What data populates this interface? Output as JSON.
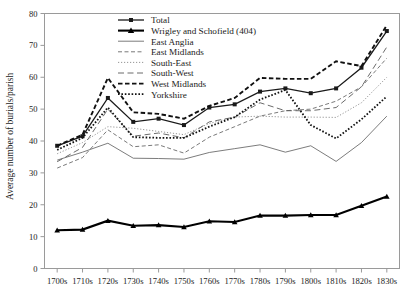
{
  "chart_data": {
    "type": "line",
    "title": "",
    "xlabel": "",
    "ylabel": "Average number of burials/parish",
    "ylim": [
      0,
      80
    ],
    "yticks": [
      0,
      10,
      20,
      30,
      40,
      50,
      60,
      70,
      80
    ],
    "grid": false,
    "legend_position": "top-center",
    "categories": [
      "1700s",
      "1710s",
      "1720s",
      "1730s",
      "1740s",
      "1750s",
      "1760s",
      "1770s",
      "1780s",
      "1790s",
      "1800s",
      "1810s",
      "1820s",
      "1830s"
    ],
    "series": [
      {
        "name": "Total",
        "style": "solid-square-marker",
        "color": "#1a1a1a",
        "values": [
          38.5,
          41.5,
          53.5,
          46.0,
          47.0,
          45.0,
          50.5,
          51.5,
          55.5,
          56.5,
          55.0,
          56.5,
          63.0,
          74.5
        ]
      },
      {
        "name": "Wrigley and Schofield (404)",
        "style": "thick-solid-triangle-marker",
        "color": "#000000",
        "values": [
          12.0,
          12.2,
          15.0,
          13.4,
          13.6,
          13.0,
          14.8,
          14.6,
          16.6,
          16.6,
          16.8,
          16.8,
          19.7,
          22.6
        ]
      },
      {
        "name": "East Anglia",
        "style": "thin-solid",
        "color": "#5a5a5a",
        "values": [
          34.0,
          36.5,
          39.3,
          34.6,
          34.5,
          34.3,
          36.4,
          37.6,
          38.8,
          36.5,
          38.5,
          33.6,
          39.5,
          47.8
        ]
      },
      {
        "name": "East Midlands",
        "style": "dashed",
        "color": "#6a6a6a",
        "values": [
          31.5,
          34.8,
          43.5,
          38.2,
          38.8,
          36.2,
          41.2,
          44.5,
          47.8,
          49.5,
          50.0,
          52.5,
          57.0,
          66.0
        ]
      },
      {
        "name": "South-East",
        "style": "dotted",
        "color": "#8a8a8a",
        "values": [
          36.0,
          39.5,
          44.5,
          44.0,
          43.0,
          42.0,
          45.5,
          47.5,
          47.8,
          47.5,
          47.5,
          47.4,
          52.0,
          60.0
        ]
      },
      {
        "name": "South-West",
        "style": "long-dash",
        "color": "#5a5a5a",
        "values": [
          33.5,
          38.0,
          50.0,
          41.5,
          42.5,
          41.0,
          46.0,
          47.5,
          52.0,
          49.5,
          49.5,
          50.5,
          57.0,
          69.5
        ]
      },
      {
        "name": "West Midlands",
        "style": "bold-dashed",
        "color": "#111111",
        "values": [
          38.5,
          42.0,
          59.8,
          49.0,
          48.5,
          47.0,
          51.0,
          53.5,
          59.8,
          59.5,
          59.5,
          65.0,
          63.5,
          76.3
        ]
      },
      {
        "name": "Yorkshire",
        "style": "bold-dotted",
        "color": "#111111",
        "values": [
          37.2,
          41.0,
          50.5,
          41.2,
          41.0,
          41.0,
          44.5,
          47.5,
          53.0,
          56.0,
          45.0,
          40.8,
          46.8,
          54.0
        ]
      }
    ]
  },
  "legend": {
    "items": [
      {
        "label": "Total"
      },
      {
        "label": "Wrigley and Schofield (404)"
      },
      {
        "label": "East Anglia"
      },
      {
        "label": "East Midlands"
      },
      {
        "label": "South-East"
      },
      {
        "label": "South-West"
      },
      {
        "label": "West Midlands"
      },
      {
        "label": "Yorkshire"
      }
    ]
  },
  "axes": {
    "y_title": "Average number of burials/parish",
    "y_tick_labels": [
      "0",
      "10",
      "20",
      "30",
      "40",
      "50",
      "60",
      "70",
      "80"
    ],
    "x_tick_labels": [
      "1700s",
      "1710s",
      "1720s",
      "1730s",
      "1740s",
      "1750s",
      "1760s",
      "1770s",
      "1780s",
      "1790s",
      "1800s",
      "1810s",
      "1820s",
      "1830s"
    ]
  }
}
